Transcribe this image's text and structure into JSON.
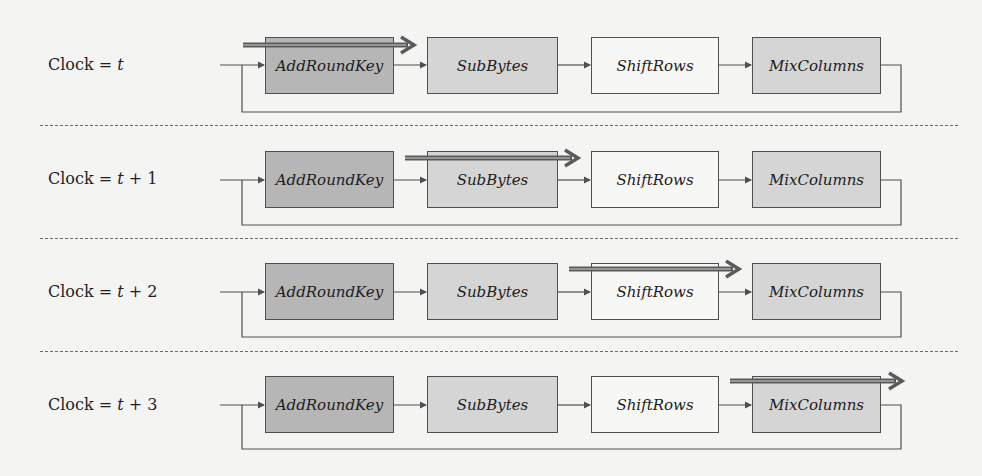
{
  "diagram": {
    "stages": [
      {
        "label": "AddRoundKey",
        "fill": "#b6b6b6"
      },
      {
        "label": "SubBytes",
        "fill": "#d5d5d5"
      },
      {
        "label": "ShiftRows",
        "fill": "#f7f7f5"
      },
      {
        "label": "MixColumns",
        "fill": "#d5d5d5"
      }
    ],
    "rows": [
      {
        "clock_prefix": "Clock = ",
        "clock_var": "t",
        "clock_offset": "",
        "active_stage": "AddRoundKey",
        "active_index": 0
      },
      {
        "clock_prefix": "Clock = ",
        "clock_var": "t",
        "clock_offset": " + 1",
        "active_stage": "SubBytes",
        "active_index": 1
      },
      {
        "clock_prefix": "Clock = ",
        "clock_var": "t",
        "clock_offset": " + 2",
        "active_stage": "ShiftRows",
        "active_index": 2
      },
      {
        "clock_prefix": "Clock = ",
        "clock_var": "t",
        "clock_offset": " + 3",
        "active_stage": "MixColumns",
        "active_index": 3
      }
    ],
    "colors": {
      "line": "#4f4f4f",
      "active_arrow": "#5a5a5a",
      "active_arrow_highlight": "#a8a8a8",
      "divider": "#6a6a6a",
      "background": "#f4f4f2"
    }
  }
}
